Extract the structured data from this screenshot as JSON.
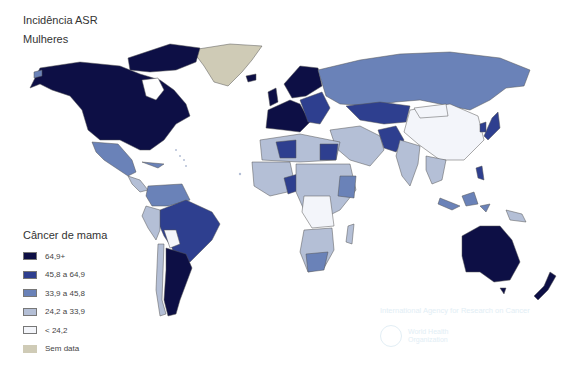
{
  "header": {
    "title": "Incidência ASR",
    "subtitle": "Mulheres"
  },
  "legend": {
    "title": "Câncer de mama",
    "items": [
      {
        "label": "64,9+",
        "color": "#0d0f45"
      },
      {
        "label": "45,8 a 64,9",
        "color": "#2e3f8f"
      },
      {
        "label": "33,9 a 45,8",
        "color": "#6a82b8"
      },
      {
        "label": "24,2 a 33,9",
        "color": "#b4bfd6"
      },
      {
        "label": "< 24,2",
        "color": "#f3f5fa"
      },
      {
        "label": "Sem data",
        "color": "#cfcbb6"
      }
    ]
  },
  "watermark": {
    "agency": "International Agency for Research on Cancer",
    "who_line1": "World Health",
    "who_line2": "Organization"
  }
}
